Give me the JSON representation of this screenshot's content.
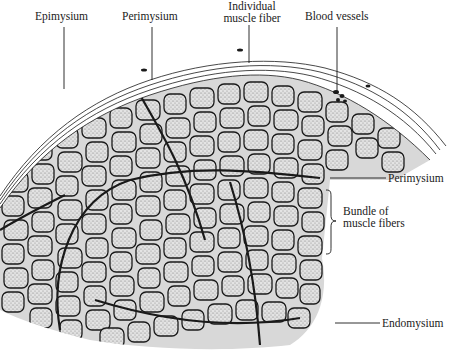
{
  "figure": {
    "labels": {
      "epimysium": "Epimysium",
      "perimysium_top": "Perimysium",
      "individual_fiber_line1": "Individual",
      "individual_fiber_line2": "muscle fiber",
      "blood_vessels": "Blood vessels",
      "perimysium_right": "Perimysium",
      "bundle_line1": "Bundle of",
      "bundle_line2": "muscle fibers",
      "endomysium": "Endomysium"
    },
    "colors": {
      "ink": "#1a1a1a",
      "stipple": "#9a9a9a",
      "background": "#ffffff"
    }
  }
}
